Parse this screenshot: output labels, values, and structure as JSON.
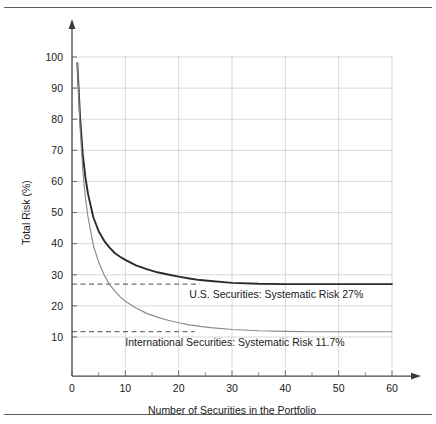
{
  "chart_data": {
    "type": "line",
    "title": "",
    "xlabel": "Number of Securities in the Portfolio",
    "ylabel": "Total Risk (%)",
    "xlim": [
      0,
      60
    ],
    "ylim": [
      0,
      105
    ],
    "grid": true,
    "legend_position": "none",
    "x_ticks": [
      "0",
      "10",
      "20",
      "30",
      "40",
      "50",
      "60"
    ],
    "x_tick_values": [
      0,
      10,
      20,
      30,
      40,
      50,
      60
    ],
    "x_minor_tick_values": [
      5,
      15,
      25,
      35,
      45,
      55
    ],
    "y_ticks": [
      "10",
      "20",
      "30",
      "40",
      "50",
      "60",
      "70",
      "80",
      "90",
      "100"
    ],
    "y_tick_values": [
      10,
      20,
      30,
      40,
      50,
      60,
      70,
      80,
      90,
      100
    ],
    "series": [
      {
        "name": "U.S. Securities",
        "color": "#2b2b2b",
        "asymptote": 27,
        "asymptote_label": "27%",
        "x": [
          1,
          1.5,
          2,
          2.5,
          3,
          4,
          5,
          6,
          7,
          8,
          9,
          10,
          12,
          14,
          16,
          18,
          20,
          22,
          24,
          26,
          30,
          35,
          40,
          45,
          50,
          55,
          60
        ],
        "values": [
          98,
          81,
          69,
          61.5,
          56,
          48.5,
          44,
          41,
          38.8,
          37,
          35.8,
          34.8,
          33,
          31.8,
          30.8,
          30.1,
          29.4,
          28.8,
          28.3,
          28,
          27.4,
          27.1,
          27,
          27,
          27,
          27,
          27
        ]
      },
      {
        "name": "International Securities",
        "color": "#8a8a8a",
        "asymptote": 11.7,
        "asymptote_label": "11.7%",
        "x": [
          1,
          1.5,
          2,
          2.5,
          3,
          4,
          5,
          6,
          7,
          8,
          9,
          10,
          12,
          14,
          16,
          18,
          20,
          22,
          24,
          26,
          30,
          35,
          40,
          45,
          50,
          55,
          60
        ],
        "values": [
          98,
          78,
          64,
          55,
          48.5,
          39.5,
          34,
          30,
          27,
          24.8,
          23,
          21.5,
          19.3,
          17.6,
          16.4,
          15.4,
          14.6,
          13.9,
          13.4,
          13,
          12.4,
          12,
          11.8,
          11.7,
          11.7,
          11.7,
          11.7
        ]
      }
    ],
    "annotations": [
      {
        "text": "U.S. Securities:  Systematic Risk 27%",
        "x": 22,
        "y": 22.5
      },
      {
        "text": "International Securities:  Systematic Risk 11.7%",
        "x": 10,
        "y": 7.0
      }
    ],
    "reference_lines": [
      {
        "label": "U.S. systematic risk",
        "value": 27,
        "style": "dashed",
        "color": "#4a4a4a"
      },
      {
        "label": "International systematic risk",
        "value": 11.7,
        "style": "dashed",
        "color": "#4a4a4a"
      }
    ]
  }
}
